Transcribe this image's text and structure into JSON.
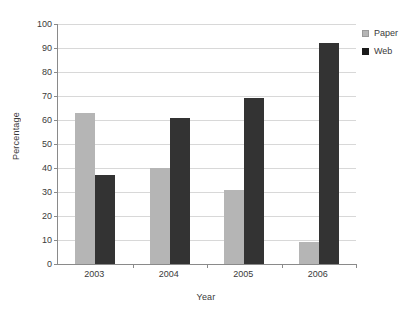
{
  "chart_data": {
    "type": "bar",
    "title": "",
    "xlabel": "Year",
    "ylabel": "Percentage",
    "categories": [
      "2003",
      "2004",
      "2005",
      "2006"
    ],
    "series": [
      {
        "name": "Paper",
        "color": "#b5b5b5",
        "values": [
          63,
          40,
          31,
          9
        ]
      },
      {
        "name": "Web",
        "color": "#333333",
        "values": [
          37,
          61,
          69,
          92
        ]
      }
    ],
    "ylim": [
      0,
      100
    ],
    "ytick_step": 10,
    "ytick_labels": [
      "0",
      "10",
      "20",
      "30",
      "40",
      "50",
      "60",
      "70",
      "80",
      "90",
      "100"
    ],
    "grid": "horizontal",
    "legend_position": "top-right",
    "annotations": []
  },
  "legend": {
    "items": [
      {
        "label": "Paper",
        "swatch": "paper-swatch"
      },
      {
        "label": "Web",
        "swatch": "web-swatch"
      }
    ]
  }
}
